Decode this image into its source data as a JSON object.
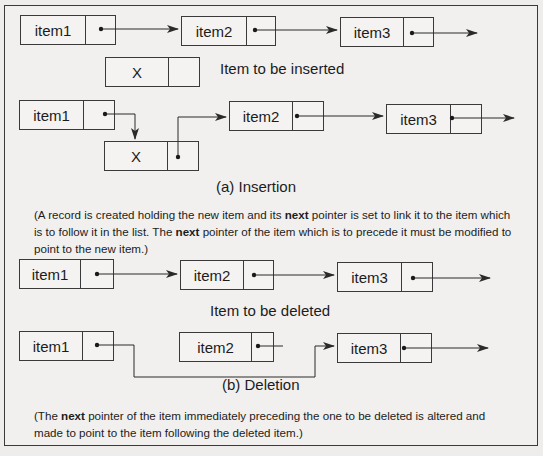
{
  "insertion": {
    "before": {
      "nodes": [
        {
          "label": "item1",
          "x": 20,
          "y": 15,
          "w": 96,
          "div": 65
        },
        {
          "label": "item2",
          "x": 181,
          "y": 16,
          "w": 95,
          "div": 65
        },
        {
          "label": "item3",
          "x": 340,
          "y": 17,
          "w": 94,
          "div": 63
        }
      ]
    },
    "new_node": {
      "label": "X",
      "x": 105,
      "y": 57,
      "w": 95,
      "div": 63
    },
    "new_node_caption": "Item to be inserted",
    "after": {
      "nodes": [
        {
          "label": "item1",
          "x": 19,
          "y": 100,
          "w": 96,
          "div": 64
        },
        {
          "label": "X",
          "x": 104,
          "y": 141,
          "w": 95,
          "div": 63
        },
        {
          "label": "item2",
          "x": 229,
          "y": 101,
          "w": 95,
          "div": 63
        },
        {
          "label": "item3",
          "x": 386,
          "y": 104,
          "w": 96,
          "div": 64
        }
      ]
    },
    "caption": "(a)  Insertion",
    "explanation": {
      "part1": "(A  record is created holding the new item and its ",
      "bold1": "next",
      "part2": " pointer is set to link it to the item which is to follow it in the list. The ",
      "bold2": "next",
      "part3": " pointer of the item which is to precede  it  must  be modified to point to the new item.)"
    }
  },
  "deletion": {
    "before": {
      "nodes": [
        {
          "label": "item1",
          "x": 19,
          "y": 259,
          "w": 95,
          "div": 61
        },
        {
          "label": "item2",
          "x": 180,
          "y": 260,
          "w": 94,
          "div": 63
        },
        {
          "label": "item3",
          "x": 337,
          "y": 262,
          "w": 96,
          "div": 64
        }
      ]
    },
    "deleted_caption": "Item to be deleted",
    "after": {
      "nodes": [
        {
          "label": "item1",
          "x": 19,
          "y": 331,
          "w": 95,
          "div": 63
        },
        {
          "label": "item2",
          "x": 179,
          "y": 332,
          "w": 95,
          "div": 72
        },
        {
          "label": "item3",
          "x": 337,
          "y": 333,
          "w": 95,
          "div": 63
        }
      ]
    },
    "caption": "(b) Deletion",
    "explanation": {
      "part1": "(The  ",
      "bold1": "next",
      "part2": " pointer of the item immediately preceding the one to be deleted is altered  and made to point  to  the  item  following the deleted item.)"
    }
  },
  "colors": {
    "line": "#2a2a2a",
    "background": "#eeedeb"
  }
}
